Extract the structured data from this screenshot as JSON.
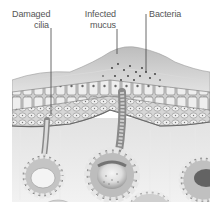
{
  "figure": {
    "type": "anatomical-illustration",
    "colors": {
      "background": "#ffffff",
      "label_text": "#555555",
      "leader_line": "#444444",
      "mucus_top": "#cfcfcf",
      "cell_fill": "#e4e4e4",
      "cell_outline": "#7a7a7a",
      "submucosa": "#d2d2d2",
      "gland": "#bdbdbd"
    }
  },
  "labels": [
    {
      "id": "damaged-cilia",
      "lines": [
        "Damaged",
        "cilia"
      ]
    },
    {
      "id": "infected-mucus",
      "lines": [
        "Infected",
        "mucus"
      ]
    },
    {
      "id": "bacteria",
      "lines": [
        "Bacteria"
      ]
    }
  ]
}
